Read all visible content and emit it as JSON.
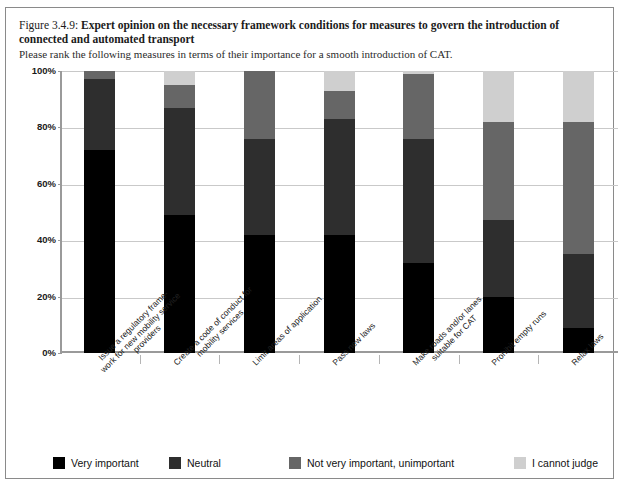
{
  "figure": {
    "number": "Figure 3.4.9:",
    "title": "Expert opinion on the necessary framework conditions for measures to govern the introduction of connected and automated transport",
    "subtitle": "Please rank the following measures in terms of their importance for a smooth introduction of CAT."
  },
  "chart_data": {
    "type": "bar",
    "subtype": "stacked-100-percent",
    "title": "Expert opinion on the necessary framework conditions for measures to govern the introduction of connected and automated transport",
    "subtitle": "Please rank the following measures in terms of their importance for a smooth introduction of CAT.",
    "xlabel": "",
    "ylabel": "",
    "ylim": [
      0,
      100
    ],
    "yticks": [
      "0%",
      "20%",
      "40%",
      "60%",
      "80%",
      "100%"
    ],
    "ytick_values": [
      0,
      20,
      40,
      60,
      80,
      100
    ],
    "grid": true,
    "legend_position": "bottom",
    "categories": [
      "Issue a regulatory frame-work for new mobility service providers",
      "Create a code of conduct for mobility services",
      "Limit areas of application",
      "Pass new laws",
      "Make roads and/or lanes suitable for CAT",
      "Prohibit empty runs",
      "Relax laws"
    ],
    "category_lines": [
      [
        "Issue a regulatory frame-",
        "work for new mobility service",
        "providers"
      ],
      [
        "Create a code of conduct for",
        "mobility services"
      ],
      [
        "Limit areas of application"
      ],
      [
        "Pass new laws"
      ],
      [
        "Make roads and/or lanes",
        "suitable for CAT"
      ],
      [
        "Prohibit empty runs"
      ],
      [
        "Relax laws"
      ]
    ],
    "series": [
      {
        "name": "Very important",
        "color": "#000000",
        "values": [
          72,
          49,
          42,
          42,
          32,
          20,
          9
        ]
      },
      {
        "name": "Neutral",
        "color": "#2e2e2e",
        "values": [
          25,
          38,
          34,
          41,
          44,
          27,
          26
        ]
      },
      {
        "name": "Not very important, unimportant",
        "color": "#666666",
        "values": [
          3,
          8,
          24,
          10,
          23,
          35,
          47
        ]
      },
      {
        "name": "I cannot judge",
        "color": "#cfcfcf",
        "values": [
          0,
          5,
          0,
          7,
          1,
          18,
          18
        ]
      }
    ]
  },
  "legend": {
    "items": [
      {
        "label": "Very important",
        "color": "#000000"
      },
      {
        "label": "Neutral",
        "color": "#2e2e2e"
      },
      {
        "label": "Not very important, unimportant",
        "color": "#666666"
      },
      {
        "label": "I cannot judge",
        "color": "#cfcfcf"
      }
    ]
  },
  "colors": {
    "frame": "#8a8a8a",
    "axis": "#9a9a9a",
    "grid": "#c9c9c9",
    "background": "#ffffff"
  }
}
